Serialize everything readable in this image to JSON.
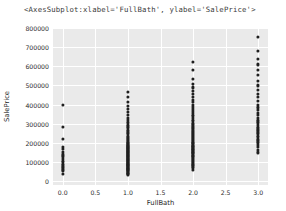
{
  "output": {
    "repr_text": "<AxesSubplot:xlabel='FullBath', ylabel='SalePrice'>"
  },
  "chart_data": {
    "type": "scatter",
    "title": "",
    "xlabel": "FullBath",
    "ylabel": "SalePrice",
    "xlim": [
      -0.15,
      3.15
    ],
    "ylim": [
      -20000,
      800000
    ],
    "xticks": [
      0.0,
      0.5,
      1.0,
      1.5,
      2.0,
      2.5,
      3.0
    ],
    "xtick_labels": [
      "0.0",
      "0.5",
      "1.0",
      "1.5",
      "2.0",
      "2.5",
      "3.0"
    ],
    "yticks": [
      0,
      100000,
      200000,
      300000,
      400000,
      500000,
      600000,
      700000,
      800000
    ],
    "ytick_labels": [
      "0",
      "100000",
      "200000",
      "300000",
      "400000",
      "500000",
      "600000",
      "700000",
      "800000"
    ],
    "grid": true,
    "grid_color": "#ffffff",
    "axes_facecolor": "#eaeaea",
    "marker_color": "#1f1f1f",
    "legend": null,
    "style": "seaborn-darkgrid",
    "series": [
      {
        "name": "SalePrice vs FullBath",
        "points": [
          [
            0,
            40000
          ],
          [
            0,
            52000
          ],
          [
            0,
            60000
          ],
          [
            0,
            67000
          ],
          [
            0,
            73000
          ],
          [
            0,
            82000
          ],
          [
            0,
            90000
          ],
          [
            0,
            99000
          ],
          [
            0,
            106000
          ],
          [
            0,
            118000
          ],
          [
            0,
            129000
          ],
          [
            0,
            140000
          ],
          [
            0,
            154000
          ],
          [
            0,
            167000
          ],
          [
            0,
            180000
          ],
          [
            0,
            220000
          ],
          [
            0,
            285000
          ],
          [
            0,
            400000
          ],
          [
            1,
            35000
          ],
          [
            1,
            39000
          ],
          [
            1,
            42000
          ],
          [
            1,
            45000
          ],
          [
            1,
            48000
          ],
          [
            1,
            52000
          ],
          [
            1,
            55000
          ],
          [
            1,
            58000
          ],
          [
            1,
            61000
          ],
          [
            1,
            64000
          ],
          [
            1,
            67000
          ],
          [
            1,
            70000
          ],
          [
            1,
            73000
          ],
          [
            1,
            76000
          ],
          [
            1,
            79000
          ],
          [
            1,
            82000
          ],
          [
            1,
            85000
          ],
          [
            1,
            88000
          ],
          [
            1,
            91000
          ],
          [
            1,
            94000
          ],
          [
            1,
            97000
          ],
          [
            1,
            100000
          ],
          [
            1,
            103000
          ],
          [
            1,
            106000
          ],
          [
            1,
            109000
          ],
          [
            1,
            112000
          ],
          [
            1,
            115000
          ],
          [
            1,
            118000
          ],
          [
            1,
            121000
          ],
          [
            1,
            124000
          ],
          [
            1,
            127000
          ],
          [
            1,
            130000
          ],
          [
            1,
            133000
          ],
          [
            1,
            136000
          ],
          [
            1,
            139000
          ],
          [
            1,
            142000
          ],
          [
            1,
            145000
          ],
          [
            1,
            148000
          ],
          [
            1,
            151000
          ],
          [
            1,
            154000
          ],
          [
            1,
            157000
          ],
          [
            1,
            160000
          ],
          [
            1,
            163000
          ],
          [
            1,
            166000
          ],
          [
            1,
            169000
          ],
          [
            1,
            172000
          ],
          [
            1,
            175000
          ],
          [
            1,
            178000
          ],
          [
            1,
            181000
          ],
          [
            1,
            184000
          ],
          [
            1,
            187000
          ],
          [
            1,
            190000
          ],
          [
            1,
            194000
          ],
          [
            1,
            198000
          ],
          [
            1,
            202000
          ],
          [
            1,
            206000
          ],
          [
            1,
            210000
          ],
          [
            1,
            215000
          ],
          [
            1,
            220000
          ],
          [
            1,
            226000
          ],
          [
            1,
            232000
          ],
          [
            1,
            238000
          ],
          [
            1,
            245000
          ],
          [
            1,
            252000
          ],
          [
            1,
            260000
          ],
          [
            1,
            268000
          ],
          [
            1,
            277000
          ],
          [
            1,
            286000
          ],
          [
            1,
            296000
          ],
          [
            1,
            307000
          ],
          [
            1,
            318000
          ],
          [
            1,
            330000
          ],
          [
            1,
            345000
          ],
          [
            1,
            360000
          ],
          [
            1,
            378000
          ],
          [
            1,
            392000
          ],
          [
            1,
            412000
          ],
          [
            1,
            438000
          ],
          [
            1,
            465000
          ],
          [
            2,
            60000
          ],
          [
            2,
            68000
          ],
          [
            2,
            75000
          ],
          [
            2,
            82000
          ],
          [
            2,
            88000
          ],
          [
            2,
            94000
          ],
          [
            2,
            100000
          ],
          [
            2,
            105000
          ],
          [
            2,
            110000
          ],
          [
            2,
            115000
          ],
          [
            2,
            120000
          ],
          [
            2,
            125000
          ],
          [
            2,
            130000
          ],
          [
            2,
            134000
          ],
          [
            2,
            138000
          ],
          [
            2,
            142000
          ],
          [
            2,
            146000
          ],
          [
            2,
            150000
          ],
          [
            2,
            154000
          ],
          [
            2,
            158000
          ],
          [
            2,
            162000
          ],
          [
            2,
            166000
          ],
          [
            2,
            170000
          ],
          [
            2,
            174000
          ],
          [
            2,
            178000
          ],
          [
            2,
            182000
          ],
          [
            2,
            186000
          ],
          [
            2,
            190000
          ],
          [
            2,
            194000
          ],
          [
            2,
            198000
          ],
          [
            2,
            202000
          ],
          [
            2,
            206000
          ],
          [
            2,
            210000
          ],
          [
            2,
            215000
          ],
          [
            2,
            220000
          ],
          [
            2,
            225000
          ],
          [
            2,
            230000
          ],
          [
            2,
            235000
          ],
          [
            2,
            240000
          ],
          [
            2,
            246000
          ],
          [
            2,
            252000
          ],
          [
            2,
            258000
          ],
          [
            2,
            264000
          ],
          [
            2,
            270000
          ],
          [
            2,
            277000
          ],
          [
            2,
            284000
          ],
          [
            2,
            291000
          ],
          [
            2,
            298000
          ],
          [
            2,
            306000
          ],
          [
            2,
            314000
          ],
          [
            2,
            322000
          ],
          [
            2,
            330000
          ],
          [
            2,
            339000
          ],
          [
            2,
            348000
          ],
          [
            2,
            357000
          ],
          [
            2,
            367000
          ],
          [
            2,
            377000
          ],
          [
            2,
            388000
          ],
          [
            2,
            400000
          ],
          [
            2,
            412000
          ],
          [
            2,
            425000
          ],
          [
            2,
            440000
          ],
          [
            2,
            455000
          ],
          [
            2,
            472000
          ],
          [
            2,
            490000
          ],
          [
            2,
            510000
          ],
          [
            2,
            535000
          ],
          [
            2,
            582000
          ],
          [
            2,
            625000
          ],
          [
            3,
            150000
          ],
          [
            3,
            165000
          ],
          [
            3,
            178000
          ],
          [
            3,
            190000
          ],
          [
            3,
            200000
          ],
          [
            3,
            208000
          ],
          [
            3,
            215000
          ],
          [
            3,
            222000
          ],
          [
            3,
            230000
          ],
          [
            3,
            238000
          ],
          [
            3,
            245000
          ],
          [
            3,
            252000
          ],
          [
            3,
            260000
          ],
          [
            3,
            268000
          ],
          [
            3,
            276000
          ],
          [
            3,
            285000
          ],
          [
            3,
            294000
          ],
          [
            3,
            303000
          ],
          [
            3,
            312000
          ],
          [
            3,
            322000
          ],
          [
            3,
            332000
          ],
          [
            3,
            345000
          ],
          [
            3,
            358000
          ],
          [
            3,
            372000
          ],
          [
            3,
            385000
          ],
          [
            3,
            400000
          ],
          [
            3,
            418000
          ],
          [
            3,
            438000
          ],
          [
            3,
            455000
          ],
          [
            3,
            475000
          ],
          [
            3,
            500000
          ],
          [
            3,
            525000
          ],
          [
            3,
            555000
          ],
          [
            3,
            582000
          ],
          [
            3,
            610000
          ],
          [
            3,
            640000
          ],
          [
            3,
            680000
          ],
          [
            3,
            755000
          ]
        ]
      }
    ]
  }
}
